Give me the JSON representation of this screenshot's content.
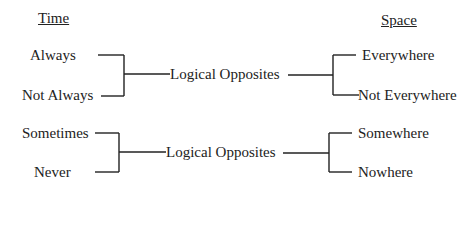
{
  "headers": {
    "left": "Time",
    "right": "Space"
  },
  "groups": [
    {
      "left": [
        "Always",
        "Not Always"
      ],
      "center": "Logical Opposites",
      "right": [
        "Everywhere",
        "Not Everywhere"
      ]
    },
    {
      "left": [
        "Sometimes",
        "Never"
      ],
      "center": "Logical Opposites",
      "right": [
        "Somewhere",
        "Nowhere"
      ]
    }
  ]
}
